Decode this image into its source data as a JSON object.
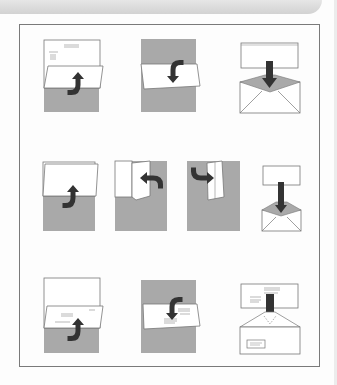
{
  "figure": {
    "colors": {
      "paper": "#ffffff",
      "shade": "#a9a9a9",
      "arrow": "#333333",
      "outline": "#6e6e6e",
      "frame": "#7a7a7a",
      "band": "#d6d6d6"
    },
    "rows": [
      {
        "name": "letter-fold-standard-envelope",
        "steps": [
          {
            "id": "fold-bottom-third-up",
            "arrow": "up"
          },
          {
            "id": "fold-top-third-down",
            "arrow": "down"
          },
          {
            "id": "insert-into-envelope",
            "arrow": "down"
          }
        ]
      },
      {
        "name": "letter-fold-small-envelope",
        "steps": [
          {
            "id": "fold-bottom-half-up",
            "arrow": "up"
          },
          {
            "id": "fold-right-third-left",
            "arrow": "left"
          },
          {
            "id": "fold-left-third-right",
            "arrow": "right"
          },
          {
            "id": "insert-into-small-envelope",
            "arrow": "down"
          }
        ]
      },
      {
        "name": "letter-fold-window-envelope",
        "steps": [
          {
            "id": "fold-bottom-third-up-address",
            "arrow": "up"
          },
          {
            "id": "fold-top-third-down-address-out",
            "arrow": "down"
          },
          {
            "id": "insert-into-window-envelope",
            "arrow": "down"
          }
        ]
      }
    ]
  }
}
